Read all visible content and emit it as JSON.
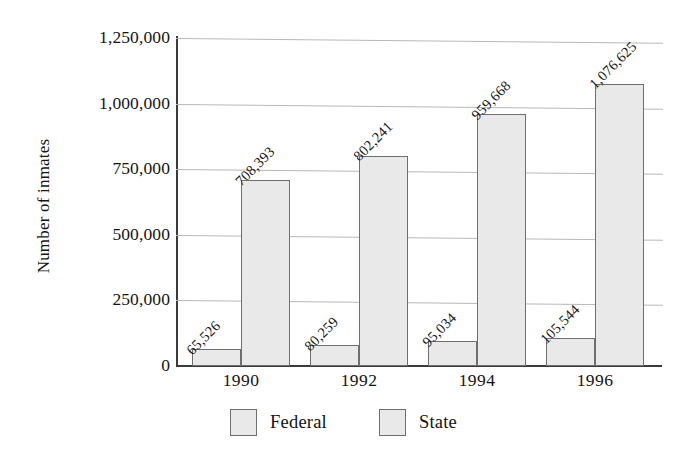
{
  "chart_data": {
    "type": "bar",
    "title": "",
    "xlabel": "",
    "ylabel": "Number of inmates",
    "categories": [
      "1990",
      "1992",
      "1994",
      "1996"
    ],
    "series": [
      {
        "name": "Federal",
        "values": [
          65526,
          80259,
          95034,
          105544
        ],
        "labels": [
          "65,526",
          "80,259",
          "95,034",
          "105,544"
        ]
      },
      {
        "name": "State",
        "values": [
          708393,
          802241,
          959668,
          1076625
        ],
        "labels": [
          "708,393",
          "802,241",
          "959,668",
          "1,076,625"
        ]
      }
    ],
    "ylim": [
      0,
      1250000
    ],
    "ytick_values": [
      0,
      250000,
      500000,
      750000,
      1000000,
      1250000
    ],
    "ytick_labels": [
      "0",
      "250,000",
      "500,000",
      "750,000",
      "1,000,000",
      "1,250,000"
    ],
    "grid": true,
    "grid_axis": "y",
    "legend_position": "bottom",
    "legend_entries": [
      "Federal",
      "State"
    ],
    "value_labels_shown": true,
    "value_label_rotation": 45,
    "colors": {
      "bar_fill": "#e9e9e9",
      "bar_border": "#6f6f6f",
      "gridline": "#b9b9b9",
      "axis": "#3b3b3b",
      "text": "#141414",
      "background": "#ffffff"
    }
  }
}
